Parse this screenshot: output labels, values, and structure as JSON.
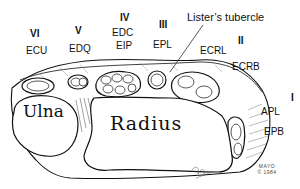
{
  "figure": {
    "compartments": [
      {
        "numeral": "VI",
        "tendons": [
          "ECU"
        ]
      },
      {
        "numeral": "V",
        "tendons": [
          "EDQ"
        ]
      },
      {
        "numeral": "IV",
        "tendons": [
          "EDC",
          "EIP"
        ]
      },
      {
        "numeral": "III",
        "tendons": [
          "EPL"
        ]
      },
      {
        "numeral": "II",
        "tendons": [
          "ECRL",
          "ECRB"
        ]
      },
      {
        "numeral": "I",
        "tendons": [
          "APL",
          "EPB"
        ]
      }
    ],
    "landmark": "Lister’s tubercle",
    "bones": {
      "ulna": "Ulna",
      "radius": "Radius"
    },
    "credit": {
      "line1": "MAYO",
      "line2": "© 1984"
    },
    "colors": {
      "ink": "#111111",
      "background": "#ffffff"
    }
  }
}
